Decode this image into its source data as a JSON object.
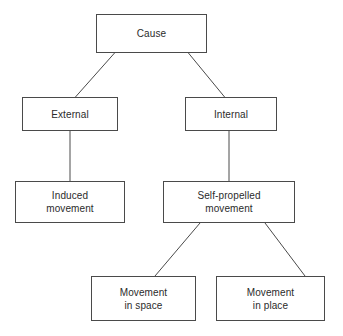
{
  "diagram": {
    "type": "tree",
    "title": "Cause",
    "background_color": "#ffffff",
    "line_color": "#4a4a4a",
    "text_color": "#2b2b2b",
    "nodes": [
      {
        "id": "cause",
        "label": "Cause",
        "level": 0
      },
      {
        "id": "external",
        "label": "External",
        "level": 1
      },
      {
        "id": "internal",
        "label": "Internal",
        "level": 1
      },
      {
        "id": "induced",
        "label": "Induced\nmovement",
        "level": 2
      },
      {
        "id": "selfpropelled",
        "label": "Self-propelled\nmovement",
        "level": 2
      },
      {
        "id": "space",
        "label": "Movement\nin space",
        "level": 3
      },
      {
        "id": "place",
        "label": "Movement\nin place",
        "level": 3
      }
    ],
    "edges": [
      {
        "from": "cause",
        "to": "external",
        "style": "diagonal"
      },
      {
        "from": "cause",
        "to": "internal",
        "style": "diagonal"
      },
      {
        "from": "external",
        "to": "induced",
        "style": "vertical"
      },
      {
        "from": "internal",
        "to": "selfpropelled",
        "style": "vertical"
      },
      {
        "from": "selfpropelled",
        "to": "space",
        "style": "diagonal"
      },
      {
        "from": "selfpropelled",
        "to": "place",
        "style": "diagonal"
      }
    ]
  }
}
